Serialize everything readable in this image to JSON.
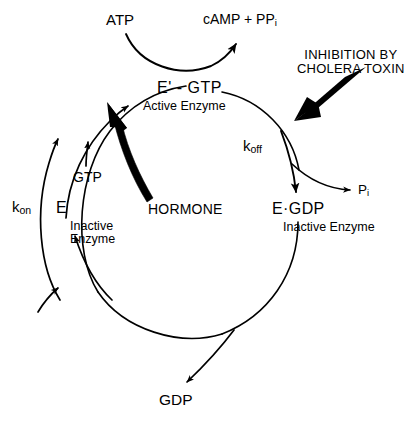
{
  "diagram": {
    "stroke_color": "#000000",
    "background_color": "#ffffff",
    "nodes": {
      "atp": "ATP",
      "camp": "cAMP + PP",
      "camp_sub": "i",
      "active_complex": "E' - GTP",
      "active_caption": "Active Enzyme",
      "inactive_complex": "E·GDP",
      "inactive_caption_right": "Inactive Enzyme",
      "free_enzyme": "E",
      "free_enzyme_caption_line1": "Inactive",
      "free_enzyme_caption_line2": "Enzyme",
      "gtp": "GTP",
      "gdp": "GDP",
      "pi": "P",
      "pi_sub": "i",
      "hormone": "HORMONE"
    },
    "rate_constants": {
      "k_on_base": "k",
      "k_on_sub": "on",
      "k_off_base": "k",
      "k_off_sub": "off"
    },
    "annotation": {
      "inhibition_line1": "INHIBITION BY",
      "inhibition_line2": "CHOLERA TOXIN"
    }
  }
}
